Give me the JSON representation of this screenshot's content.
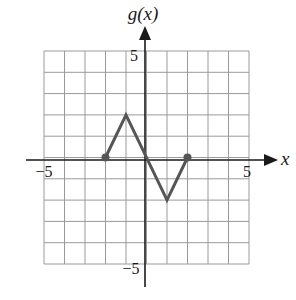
{
  "chart_data": {
    "type": "line",
    "title": "",
    "xlabel": "x",
    "ylabel": "g(x)",
    "xlim": [
      -5,
      5
    ],
    "ylim": [
      -5,
      5
    ],
    "grid": true,
    "x_ticks_labeled": [
      -5,
      5
    ],
    "y_ticks_labeled": [
      5,
      -5
    ],
    "x_tick_labels": [
      "−5",
      "5"
    ],
    "y_tick_labels": [
      "5",
      "−5"
    ],
    "series": [
      {
        "name": "g(x)",
        "points": [
          [
            -2,
            0
          ],
          [
            -1,
            2
          ],
          [
            1,
            -2
          ],
          [
            2,
            0
          ]
        ],
        "closed_endpoints": [
          [
            -2,
            0
          ],
          [
            2,
            0
          ]
        ],
        "color": "#555555"
      }
    ]
  },
  "axes": {
    "x_label": "x",
    "y_label": "g(x)",
    "x_min_label": "−5",
    "x_max_label": "5",
    "y_max_label": "5",
    "y_min_label": "−5"
  },
  "colors": {
    "grid": "#9a9a9a",
    "axis": "#1a1a1a",
    "curve": "#555555"
  }
}
